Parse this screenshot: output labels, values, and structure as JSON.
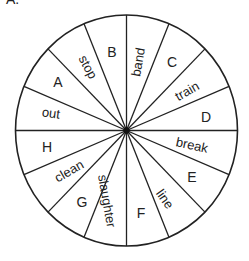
{
  "figure": {
    "clipped_label": "A.",
    "wheel": {
      "center": [
        126.5,
        130.5
      ],
      "radius_x": 111,
      "radius_y": 115.5,
      "spoke_count": 16,
      "line_color": "#222222",
      "hub_color": "#111111"
    },
    "segments": [
      {
        "text": "B",
        "kind": "letter",
        "x": 112,
        "y": 52,
        "rotate": 0
      },
      {
        "text": "stop",
        "kind": "word",
        "x": 88,
        "y": 67,
        "rotate": 62
      },
      {
        "text": "A",
        "kind": "letter",
        "x": 58,
        "y": 82,
        "rotate": 0
      },
      {
        "text": "out",
        "kind": "word",
        "x": 51,
        "y": 113,
        "rotate": 8
      },
      {
        "text": "H",
        "kind": "letter",
        "x": 47,
        "y": 147,
        "rotate": 0
      },
      {
        "text": "clean",
        "kind": "word",
        "x": 69,
        "y": 171,
        "rotate": -30
      },
      {
        "text": "G",
        "kind": "letter",
        "x": 82,
        "y": 202,
        "rotate": 0
      },
      {
        "text": "slaughter",
        "kind": "word",
        "x": 107,
        "y": 201,
        "rotate": 80
      },
      {
        "text": "F",
        "kind": "letter",
        "x": 141,
        "y": 213,
        "rotate": 0
      },
      {
        "text": "line",
        "kind": "word",
        "x": 165,
        "y": 199,
        "rotate": 55
      },
      {
        "text": "E",
        "kind": "letter",
        "x": 192,
        "y": 177,
        "rotate": 0
      },
      {
        "text": "break",
        "kind": "word",
        "x": 192,
        "y": 145,
        "rotate": 12
      },
      {
        "text": "D",
        "kind": "letter",
        "x": 206,
        "y": 117,
        "rotate": 0
      },
      {
        "text": "train",
        "kind": "word",
        "x": 187,
        "y": 91,
        "rotate": -30
      },
      {
        "text": "C",
        "kind": "letter",
        "x": 172,
        "y": 62,
        "rotate": 0
      },
      {
        "text": "band",
        "kind": "word",
        "x": 138,
        "y": 62,
        "rotate": -80
      }
    ]
  }
}
